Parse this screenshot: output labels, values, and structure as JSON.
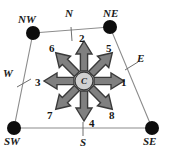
{
  "figure": {
    "type": "compass-cell-diagram",
    "center": {
      "label": "C",
      "name": "center-node",
      "x": 84,
      "y": 81,
      "radius": 9
    },
    "colors": {
      "arrow_fill": "#808080",
      "arrow_stroke": "#3a3a3a",
      "node_fill": "#0d0d0d",
      "polygon_stroke": "#8c8c8c",
      "center_fill": "#d0d0d0",
      "text": "#141414",
      "background": "#ffffff"
    },
    "polygon": {
      "name": "cell-boundary",
      "points": "33,33 110,27 152,128 14,128"
    },
    "corners": [
      {
        "id": "NW",
        "label": "NW",
        "x": 33,
        "y": 33,
        "lx": 18,
        "ly": 14
      },
      {
        "id": "NE",
        "label": "NE",
        "x": 110,
        "y": 27,
        "lx": 103,
        "ly": 8
      },
      {
        "id": "SW",
        "label": "SW",
        "x": 14,
        "y": 128,
        "lx": 4,
        "ly": 136
      },
      {
        "id": "SE",
        "label": "SE",
        "x": 152,
        "y": 128,
        "lx": 143,
        "ly": 136
      }
    ],
    "edge_marks": [
      {
        "id": "N",
        "label": "N",
        "tick": "71,27 72,41",
        "lx": 65,
        "ly": 8
      },
      {
        "id": "S",
        "label": "S",
        "tick": "83,122 83,136",
        "lx": 80,
        "ly": 137
      },
      {
        "id": "W",
        "label": "W",
        "tick": "17,87 31,79",
        "lx": 3,
        "ly": 68
      },
      {
        "id": "E",
        "label": "E",
        "tick": "125,70 138,62",
        "lx": 137,
        "ly": 53
      }
    ],
    "arrows": [
      {
        "num": "1",
        "dir": "E",
        "angle": 0,
        "lx": 121,
        "ly": 77
      },
      {
        "num": "2",
        "dir": "N",
        "angle": 270,
        "lx": 79,
        "ly": 33
      },
      {
        "num": "3",
        "dir": "W",
        "angle": 180,
        "lx": 35,
        "ly": 77
      },
      {
        "num": "4",
        "dir": "S",
        "angle": 90,
        "lx": 89,
        "ly": 118
      },
      {
        "num": "5",
        "dir": "NE",
        "angle": 315,
        "lx": 106,
        "ly": 43
      },
      {
        "num": "6",
        "dir": "NW",
        "angle": 225,
        "lx": 49,
        "ly": 43
      },
      {
        "num": "7",
        "dir": "SW",
        "angle": 135,
        "lx": 47,
        "ly": 110
      },
      {
        "num": "8",
        "dir": "SE",
        "angle": 45,
        "lx": 109,
        "ly": 110
      }
    ]
  }
}
